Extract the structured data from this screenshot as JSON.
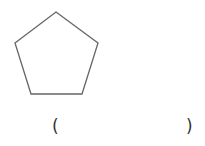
{
  "figure": {
    "shape": "pentagon",
    "stroke_color": "#666666",
    "fill_color": "#ffffff"
  },
  "answer_blank": {
    "open": "(",
    "close": ")",
    "value": ""
  }
}
